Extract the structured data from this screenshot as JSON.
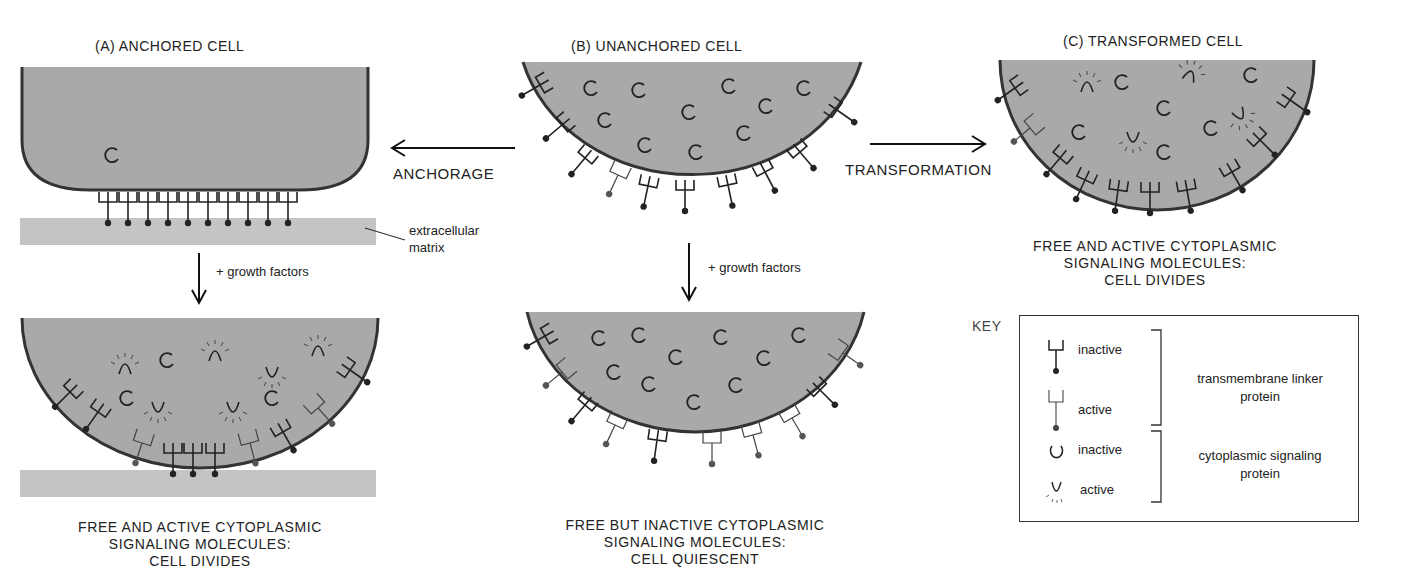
{
  "panels": {
    "a": {
      "title": "(A)  ANCHORED CELL",
      "caption": [
        "FREE AND ACTIVE CYTOPLASMIC",
        "SIGNALING MOLECULES:",
        "CELL DIVIDES"
      ]
    },
    "b": {
      "title": "(B)  UNANCHORED CELL",
      "caption": [
        "FREE BUT INACTIVE CYTOPLASMIC",
        "SIGNALING MOLECULES:",
        "CELL QUIESCENT"
      ]
    },
    "c": {
      "title": "(C)  TRANSFORMED CELL",
      "caption": [
        "FREE AND ACTIVE CYTOPLASMIC",
        "SIGNALING MOLECULES:",
        "CELL DIVIDES"
      ]
    }
  },
  "arrows": {
    "anchorage": "ANCHORAGE",
    "transformation": "TRANSFORMATION",
    "growth_a": "+ growth factors",
    "growth_b": "+ growth factors"
  },
  "ecm_label": [
    "extracellular",
    "matrix"
  ],
  "key": {
    "title": "KEY",
    "linker_inactive": "inactive",
    "linker_active": "active",
    "linker_group": [
      "transmembrane linker",
      "protein"
    ],
    "signal_inactive": "inactive",
    "signal_active": "active",
    "signal_group": [
      "cytoplasmic signaling",
      "protein"
    ]
  },
  "colors": {
    "cell_fill": "#a9a9a9",
    "membrane": "#3a3a3a",
    "ecm": "#c4c4c4"
  }
}
